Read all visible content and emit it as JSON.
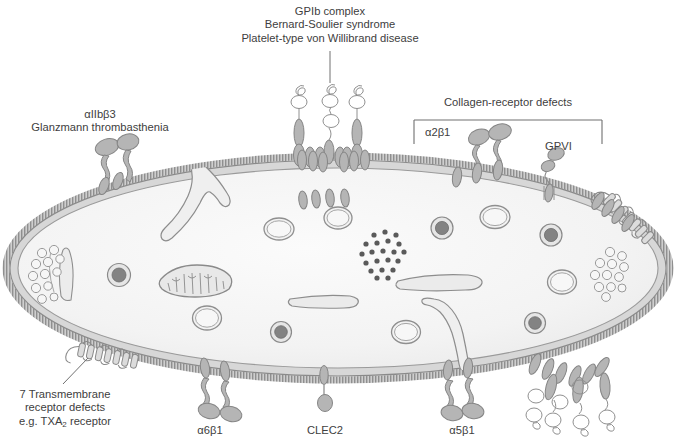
{
  "figure": {
    "title_hidden": "Platelet membrane receptors and associated disorders",
    "colors": {
      "text": "#404040",
      "membrane_fill": "#d9d9d9",
      "membrane_stroke": "#8c8c8c",
      "cytoplasm": "#f2f2f2",
      "receptor_fill": "#b3b3b3",
      "receptor_stroke": "#808080",
      "organelle_fill": "#ededed",
      "organelle_stroke": "#909090",
      "dense_granule_core": "#808080",
      "glycogen_dot": "#595959",
      "leader_line": "#707070"
    }
  },
  "labels": {
    "gpib": {
      "line1": "GPIb complex",
      "line2": "Bernard-Soulier syndrome",
      "line3": "Platelet-type von Willibrand disease"
    },
    "alpha_iib_beta3": {
      "line1": "αIIbβ3",
      "line2": "Glanzmann thrombasthenia"
    },
    "collagen": {
      "bracket_title": "Collagen-receptor defects",
      "alpha2beta1": "α2β1",
      "gpvi": "GPVI"
    },
    "seven_tm": {
      "line1": "7 Transmembrane",
      "line2": "receptor defects",
      "line3_pre": "e.g. TXA",
      "line3_sub": "2",
      "line3_post": " receptor"
    },
    "bottom": {
      "alpha6beta1": "α6β1",
      "clec2": "CLEC2",
      "alpha5beta1": "α5β1"
    }
  },
  "structures": {
    "cell": "platelet-ellipse",
    "organelles": [
      {
        "name": "open-canalicular-system",
        "count": 2
      },
      {
        "name": "mitochondrion",
        "count": 1
      },
      {
        "name": "dense-granule",
        "count": 5
      },
      {
        "name": "alpha-granule",
        "count": 6
      },
      {
        "name": "glycogen-cluster",
        "count": 1
      },
      {
        "name": "microtubule-band",
        "count": 1
      },
      {
        "name": "dense-tubular-system",
        "count": 2
      },
      {
        "name": "vesicle-cluster",
        "count": 2
      }
    ],
    "receptors": [
      {
        "name": "gpib-complex",
        "location": "top-center",
        "count": 3
      },
      {
        "name": "alpha-iib-beta3-integrin",
        "location": "top-left",
        "count": 2
      },
      {
        "name": "alpha2beta1-integrin",
        "location": "top-right",
        "count": 2
      },
      {
        "name": "gpvi-receptor",
        "location": "top-right",
        "count": 1
      },
      {
        "name": "seven-transmembrane-receptor",
        "location": "bottom-left",
        "count": 1
      },
      {
        "name": "seven-transmembrane-receptor",
        "location": "right",
        "count": 1
      },
      {
        "name": "alpha6beta1-integrin",
        "location": "bottom-left",
        "count": 2
      },
      {
        "name": "clec2-receptor",
        "location": "bottom-center",
        "count": 1
      },
      {
        "name": "alpha5beta1-integrin",
        "location": "bottom-center-right",
        "count": 2
      },
      {
        "name": "gpib-complex",
        "location": "bottom-right",
        "count": 3
      }
    ]
  }
}
